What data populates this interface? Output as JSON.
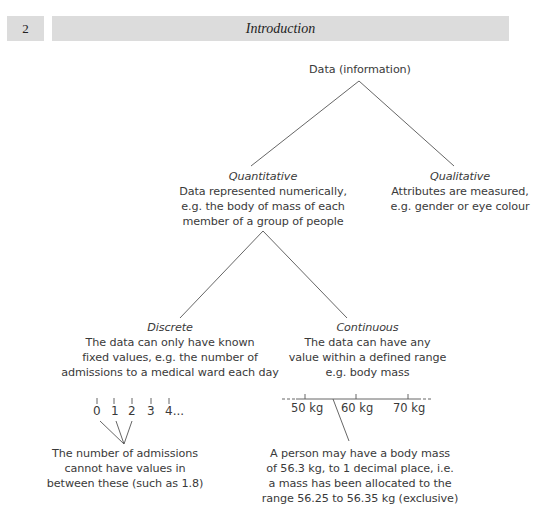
{
  "header": {
    "page_number": "2",
    "title": "Introduction"
  },
  "diagram": {
    "root": {
      "label": "Data (information)"
    },
    "quantitative": {
      "heading": "Quantitative",
      "lines": [
        "Data represented numerically,",
        "e.g. the body of mass of each",
        "member of a group of people"
      ]
    },
    "qualitative": {
      "heading": "Qualitative",
      "lines": [
        "Attributes are measured,",
        "e.g. gender or eye colour"
      ]
    },
    "discrete": {
      "heading": "Discrete",
      "lines": [
        "The data can only have known",
        "fixed values, e.g. the number of",
        "admissions to a medical ward each day"
      ],
      "scale": [
        "0",
        "1",
        "2",
        "3",
        "4..."
      ],
      "note_lines": [
        "The number of admissions",
        "cannot have values in",
        "between these (such as 1.8)"
      ]
    },
    "continuous": {
      "heading": "Continuous",
      "lines": [
        "The data can have any",
        "value within a defined range",
        "e.g. body mass"
      ],
      "scale": [
        "50 kg",
        "60 kg",
        "70 kg"
      ],
      "note_lines": [
        "A person may have a body mass",
        "of 56.3 kg, to 1 decimal place, i.e.",
        "a mass has been allocated to the",
        "range 56.25 to 56.35 kg (exclusive)"
      ]
    }
  }
}
